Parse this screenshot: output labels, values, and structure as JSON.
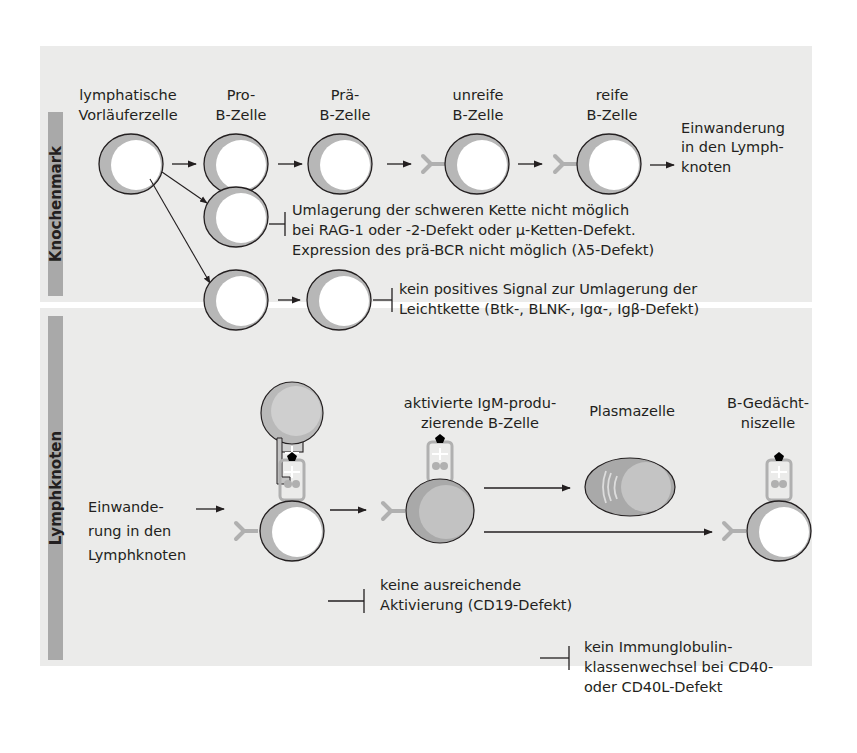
{
  "colors": {
    "panel_bg": "#ebebea",
    "sidebar": "#a9a9a9",
    "cell_outline": "#231f20",
    "cytoplasm": "#b7b7b7",
    "nucleus": "#ffffff",
    "activated_cell": "#a9a9a9",
    "activated_nucleus": "#c2c2c2",
    "receptor": "#b0b0b0",
    "antigen": "#000000"
  },
  "sections": {
    "top": {
      "label": "Knochenmark"
    },
    "bottom": {
      "label": "Lymphknoten"
    }
  },
  "knochenmark": {
    "stages": [
      {
        "line1": "lymphatische",
        "line2": "Vorläuferzelle"
      },
      {
        "line1": "Pro-",
        "line2": "B-Zelle"
      },
      {
        "line1": "Prä-",
        "line2": "B-Zelle"
      },
      {
        "line1": "unreife",
        "line2": "B-Zelle"
      },
      {
        "line1": "reife",
        "line2": "B-Zelle"
      }
    ],
    "exit_label": [
      "Einwanderung",
      "in den Lymph-",
      "knoten"
    ],
    "block1": [
      "Umlagerung der schweren Kette nicht möglich",
      "bei RAG-1 oder -2-Defekt oder μ-Ketten-Defekt.",
      "Expression des prä-BCR nicht möglich (λ5-Defekt)"
    ],
    "block2": [
      "kein positives Signal zur Umlagerung der",
      "Leichtkette (Btk-, BLNK-, Igα-, Igβ-Defekt)"
    ]
  },
  "lymphknoten": {
    "entry_label": [
      "Einwande-",
      "rung in den",
      "Lymphknoten"
    ],
    "activated_label": [
      "aktivierte IgM-produ-",
      "zierende B-Zelle"
    ],
    "plasma_label": "Plasmazelle",
    "memory_label": [
      "B-Gedächt-",
      "niszelle"
    ],
    "block_cd19": [
      "keine ausreichende",
      "Aktivierung (CD19-Defekt)"
    ],
    "block_cd40": [
      "kein Immunglobulin-",
      "klassenwechsel bei CD40-",
      "oder CD40L-Defekt"
    ]
  }
}
